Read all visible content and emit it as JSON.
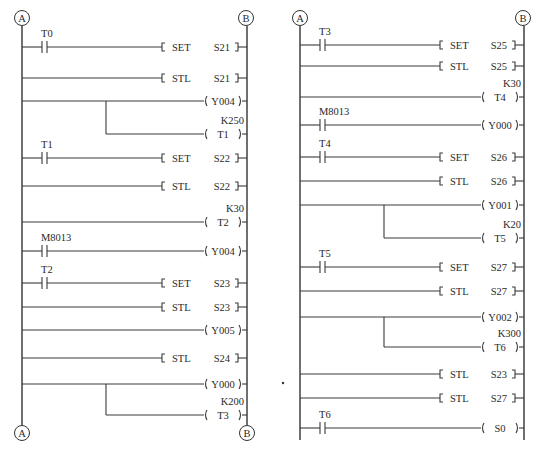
{
  "diagrams": [
    {
      "name": "left",
      "left_rail_x": 22,
      "right_rail_x": 247,
      "top_connectors": [
        "A",
        "B"
      ],
      "bottom_connectors": [
        "A",
        "B"
      ],
      "rail_top": 27,
      "rail_bottom": 425,
      "rungs": [
        {
          "y": 47,
          "contact": "T0",
          "kind": "set",
          "instr": "SET",
          "operand": "S21"
        },
        {
          "y": 78,
          "kind": "stl",
          "instr": "STL",
          "operand": "S21"
        },
        {
          "y": 101,
          "kind": "coil",
          "operand": "Y004",
          "branch_to": 134,
          "branch_x": 106
        },
        {
          "y": 134,
          "kind": "coil",
          "operand": "T1",
          "preset": "K250",
          "from_branch": 106
        },
        {
          "y": 158,
          "contact": "T1",
          "kind": "set",
          "instr": "SET",
          "operand": "S22"
        },
        {
          "y": 186,
          "kind": "stl",
          "instr": "STL",
          "operand": "S22"
        },
        {
          "y": 222,
          "kind": "coil",
          "operand": "T2",
          "preset": "K30"
        },
        {
          "y": 251,
          "contact": "M8013",
          "kind": "coil",
          "operand": "Y004"
        },
        {
          "y": 283,
          "contact": "T2",
          "kind": "set",
          "instr": "SET",
          "operand": "S23"
        },
        {
          "y": 307,
          "kind": "stl",
          "instr": "STL",
          "operand": "S23"
        },
        {
          "y": 330,
          "kind": "coil",
          "operand": "Y005"
        },
        {
          "y": 358,
          "kind": "stl",
          "instr": "STL",
          "operand": "S24"
        },
        {
          "y": 384,
          "kind": "coil",
          "operand": "Y000",
          "branch_to": 415,
          "branch_x": 106
        },
        {
          "y": 415,
          "kind": "coil",
          "operand": "T3",
          "preset": "K200",
          "from_branch": 106
        }
      ]
    },
    {
      "name": "right",
      "left_rail_x": 300,
      "right_rail_x": 524,
      "top_connectors": [
        "A",
        "B"
      ],
      "bottom_connectors": [],
      "rail_top": 27,
      "rail_bottom": 440,
      "rungs": [
        {
          "y": 45,
          "contact": "T3",
          "kind": "set",
          "instr": "SET",
          "operand": "S25"
        },
        {
          "y": 66,
          "kind": "stl",
          "instr": "STL",
          "operand": "S25"
        },
        {
          "y": 97,
          "kind": "coil",
          "operand": "T4",
          "preset": "K30"
        },
        {
          "y": 125,
          "contact": "M8013",
          "kind": "coil",
          "operand": "Y000"
        },
        {
          "y": 157,
          "contact": "T4",
          "kind": "set",
          "instr": "SET",
          "operand": "S26"
        },
        {
          "y": 181,
          "kind": "stl",
          "instr": "STL",
          "operand": "S26"
        },
        {
          "y": 205,
          "kind": "coil",
          "operand": "Y001",
          "branch_to": 238,
          "branch_x": 384
        },
        {
          "y": 238,
          "kind": "coil",
          "operand": "T5",
          "preset": "K20",
          "from_branch": 384
        },
        {
          "y": 267,
          "contact": "T5",
          "kind": "set",
          "instr": "SET",
          "operand": "S27"
        },
        {
          "y": 291,
          "kind": "stl",
          "instr": "STL",
          "operand": "S27"
        },
        {
          "y": 317,
          "kind": "coil",
          "operand": "Y002",
          "branch_to": 347,
          "branch_x": 384
        },
        {
          "y": 347,
          "kind": "coil",
          "operand": "T6",
          "preset": "K300",
          "from_branch": 384
        },
        {
          "y": 374,
          "kind": "stl",
          "instr": "STL",
          "operand": "S23"
        },
        {
          "y": 398,
          "kind": "stl",
          "instr": "STL",
          "operand": "S27"
        },
        {
          "y": 428,
          "contact": "T6",
          "kind": "coil",
          "operand": "S0"
        }
      ]
    }
  ],
  "stray_dot": {
    "x": 283,
    "y": 383
  }
}
